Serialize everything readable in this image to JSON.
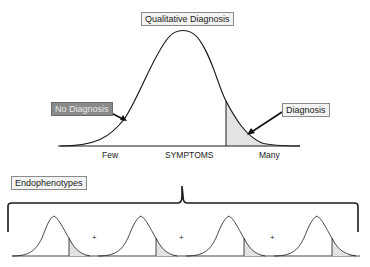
{
  "top_diagram": {
    "title": "Qualitative Diagnosis",
    "left_label": "No Diagnosis",
    "right_label": "Diagnosis",
    "axis": {
      "label": "SYMPTOMS",
      "left_end": "Few",
      "right_end": "Many"
    }
  },
  "bottom_diagram": {
    "title": "Endophenotypes",
    "curve_count": 4,
    "separators": [
      "+",
      "+",
      "+"
    ]
  },
  "colors": {
    "line": "#1a1a1a",
    "shaded_tail": "#e3e3e3",
    "dark_label_fill": "#8a8a8a",
    "light_label_fill": "#f3f3f3"
  }
}
